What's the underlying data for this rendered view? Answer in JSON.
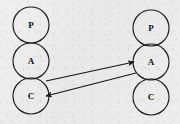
{
  "diagram": {
    "type": "node-link",
    "background_color": "#ebebeb",
    "stroke_color": "#1a1a1a",
    "label_color": "#111111",
    "columns": [
      {
        "name": "left-stack",
        "center_x": 31,
        "nodes": [
          {
            "id": "left-p",
            "label": "P",
            "cx": 31,
            "cy": 25,
            "r": 18
          },
          {
            "id": "left-a",
            "label": "A",
            "cx": 31,
            "cy": 61,
            "r": 18
          },
          {
            "id": "left-c",
            "label": "C",
            "cx": 31,
            "cy": 96,
            "r": 18
          }
        ]
      },
      {
        "name": "right-stack",
        "center_x": 151,
        "nodes": [
          {
            "id": "right-p",
            "label": "P",
            "cx": 151,
            "cy": 28,
            "r": 18
          },
          {
            "id": "right-a",
            "label": "A",
            "cx": 151,
            "cy": 62,
            "r": 18
          },
          {
            "id": "right-c",
            "label": "C",
            "cx": 151,
            "cy": 97,
            "r": 18
          }
        ]
      }
    ],
    "links": [
      {
        "id": "link-left-c-to-right-a",
        "from": "left-c",
        "to": "right-a",
        "direction": "forward",
        "arrowhead_at": "right-a",
        "x1": 46,
        "y1": 81,
        "x2": 134,
        "y2": 62
      },
      {
        "id": "link-right-a-to-left-c",
        "from": "right-a",
        "to": "left-c",
        "direction": "forward",
        "arrowhead_at": "left-c",
        "x1": 136,
        "y1": 73,
        "x2": 46,
        "y2": 96
      }
    ]
  }
}
